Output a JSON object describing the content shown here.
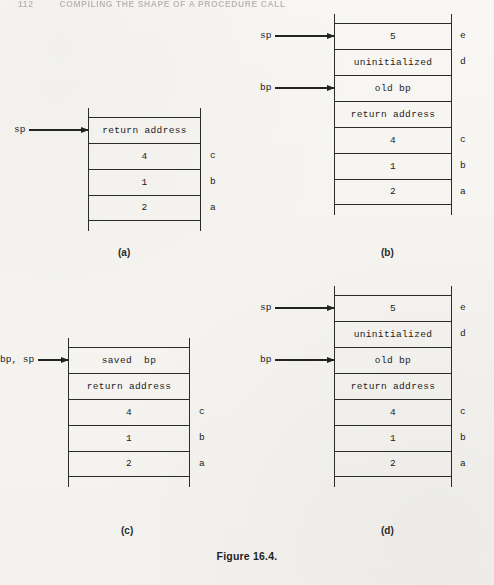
{
  "page": {
    "running_header": {
      "folio": "112",
      "text": "COMPILING THE SHAPE OF A PROCEDURE CALL"
    },
    "figure_caption": "Figure 16.4."
  },
  "chart_data": {
    "type": "diagram",
    "title": "Figure 16.4.",
    "panels": [
      {
        "id": "a",
        "caption": "(a)",
        "cells": [
          {
            "text": "return address",
            "side": ""
          },
          {
            "text": "4",
            "side": "c"
          },
          {
            "text": "1",
            "side": "b"
          },
          {
            "text": "2",
            "side": "a"
          }
        ],
        "pointers": [
          {
            "label": "sp",
            "target_index": 0
          }
        ]
      },
      {
        "id": "b",
        "caption": "(b)",
        "cells": [
          {
            "text": "5",
            "side": "e"
          },
          {
            "text": "uninitialized",
            "side": "d"
          },
          {
            "text": "old bp",
            "side": ""
          },
          {
            "text": "return address",
            "side": ""
          },
          {
            "text": "4",
            "side": "c"
          },
          {
            "text": "1",
            "side": "b"
          },
          {
            "text": "2",
            "side": "a"
          }
        ],
        "pointers": [
          {
            "label": "sp",
            "target_index": 0
          },
          {
            "label": "bp",
            "target_index": 2
          }
        ]
      },
      {
        "id": "c",
        "caption": "(c)",
        "cells": [
          {
            "text": "saved  bp",
            "side": ""
          },
          {
            "text": "return address",
            "side": ""
          },
          {
            "text": "4",
            "side": "c"
          },
          {
            "text": "1",
            "side": "b"
          },
          {
            "text": "2",
            "side": "a"
          }
        ],
        "pointers": [
          {
            "label": "bp, sp",
            "target_index": 0
          }
        ]
      },
      {
        "id": "d",
        "caption": "(d)",
        "cells": [
          {
            "text": "5",
            "side": "e"
          },
          {
            "text": "uninitialized",
            "side": "d"
          },
          {
            "text": "old bp",
            "side": ""
          },
          {
            "text": "return address",
            "side": ""
          },
          {
            "text": "4",
            "side": "c"
          },
          {
            "text": "1",
            "side": "b"
          },
          {
            "text": "2",
            "side": "a"
          }
        ],
        "pointers": [
          {
            "label": "sp",
            "target_index": 0
          },
          {
            "label": "bp",
            "target_index": 2
          }
        ]
      }
    ]
  },
  "layout": {
    "cell_height": 26,
    "rail_overhang_top": 9,
    "rail_overhang_bottom": 10,
    "panels": [
      {
        "left": 88,
        "top": 108,
        "width": 113,
        "pointer_left": 14,
        "side_left": 122
      },
      {
        "left": 334,
        "top": 14,
        "width": 118,
        "pointer_left": 260,
        "side_left": 126
      },
      {
        "left": 68,
        "top": 338,
        "width": 122,
        "pointer_left": 0,
        "side_left": 131
      },
      {
        "left": 334,
        "top": 286,
        "width": 118,
        "pointer_left": 260,
        "side_left": 126
      }
    ],
    "captions": [
      {
        "left": 118,
        "top": 248
      },
      {
        "left": 381,
        "top": 248
      },
      {
        "left": 121,
        "top": 526
      },
      {
        "left": 381,
        "top": 526
      }
    ],
    "figure_caption_top": 550
  }
}
